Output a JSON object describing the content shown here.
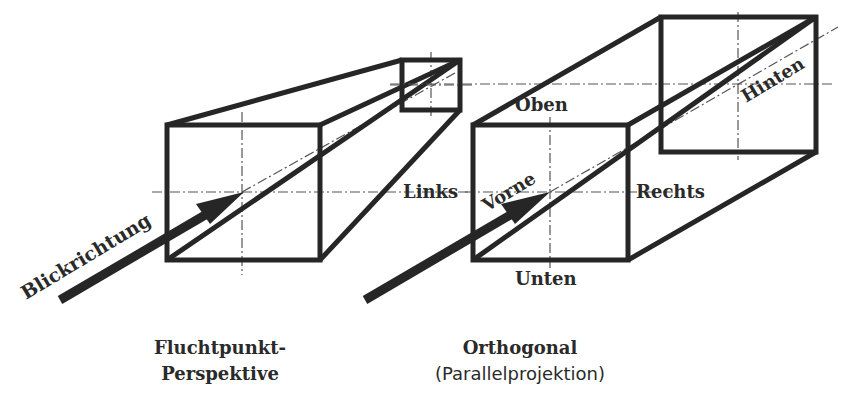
{
  "labels": {
    "view_direction": "Blickrichtung",
    "left": "Links",
    "front": "Vorne",
    "top": "Oben",
    "right": "Rechts",
    "bottom": "Unten",
    "back": "Hinten"
  },
  "captions": {
    "perspective_line1": "Fluchtpunkt-",
    "perspective_line2": "Perspektive",
    "orthogonal_title": "Orthogonal",
    "orthogonal_subtitle": "(Parallelprojektion)"
  },
  "colors": {
    "stroke": "#262626",
    "axis": "#555555",
    "background": "#ffffff"
  }
}
